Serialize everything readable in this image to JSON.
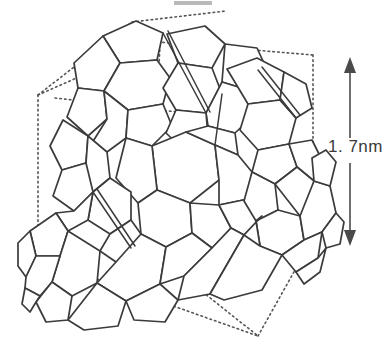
{
  "figure": {
    "type": "molecular-structure-diagram",
    "background_color": "#ffffff",
    "line_color": "#3b3b3b",
    "dotted_color": "#555555",
    "arrow_color": "#4a4a4a",
    "text_color": "#3a3a3a"
  },
  "dimension": {
    "label": "1. 7nm",
    "value": "1.7",
    "unit": "nm",
    "arrow": "double-headed-vertical",
    "arrow_top_y": 57,
    "arrow_bottom_y": 246,
    "arrow_x": 350
  },
  "unit_cell": {
    "shape": "cube",
    "style": "dotted",
    "vertices_label": "8 corners of cubic unit cell",
    "front_bottom_left": [
      38,
      258
    ],
    "front_bottom_right": [
      258,
      336
    ],
    "left": [
      38,
      95
    ],
    "top_right": [
      313,
      55
    ]
  },
  "molecules": {
    "name": "C60 buckminsterfullerene",
    "count_visible": 14,
    "face_types": [
      "pentagon",
      "hexagon"
    ]
  },
  "artifact": {
    "name": "scan-artifact-bar",
    "description": "faint grey bar at top edge of scanned figure"
  }
}
